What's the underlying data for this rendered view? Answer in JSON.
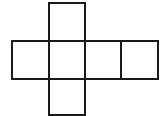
{
  "diagram": {
    "type": "cube-net",
    "stroke_color": "#1a1a1a",
    "background": "#ffffff",
    "faces": [
      {
        "id": "top",
        "x": 48,
        "y": 2,
        "w": 38,
        "h": 40
      },
      {
        "id": "middle-1",
        "x": 11,
        "y": 40,
        "w": 39,
        "h": 40
      },
      {
        "id": "middle-2",
        "x": 48,
        "y": 40,
        "w": 38,
        "h": 40
      },
      {
        "id": "middle-3",
        "x": 84,
        "y": 40,
        "w": 38,
        "h": 40
      },
      {
        "id": "middle-4",
        "x": 120,
        "y": 40,
        "w": 39,
        "h": 40
      },
      {
        "id": "bottom",
        "x": 48,
        "y": 78,
        "w": 38,
        "h": 38
      }
    ]
  }
}
